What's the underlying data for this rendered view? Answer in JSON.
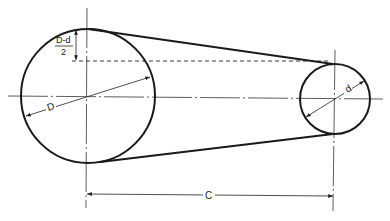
{
  "diagram": {
    "large_pulley": {
      "label": "D",
      "cx": 88,
      "cy": 96,
      "r": 67
    },
    "small_pulley": {
      "label": "d",
      "cx": 335,
      "cy": 99,
      "r": 35
    },
    "offset_dimension": {
      "numerator": "D-d",
      "denominator": "2"
    },
    "center_distance": {
      "label": "C"
    },
    "colors": {
      "line": "#1a1a1a",
      "background": "#ffffff"
    }
  }
}
